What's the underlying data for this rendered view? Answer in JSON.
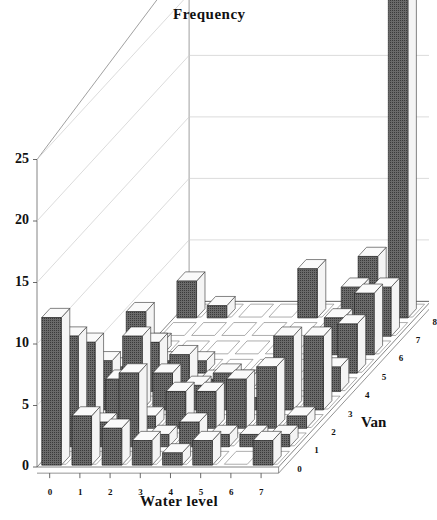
{
  "chart_data": {
    "type": "bar3d",
    "title": "Frequency",
    "xlabel": "Water level",
    "zlabel": "Van",
    "ylabel": "Frequency",
    "y_ticks": [
      "0",
      "5",
      "10",
      "15",
      "20",
      "25"
    ],
    "ylim": [
      0,
      25
    ],
    "x_categories": [
      "0",
      "1",
      "2",
      "3",
      "4",
      "5",
      "6",
      "7"
    ],
    "z_categories": [
      "0",
      "1",
      "2",
      "3",
      "4",
      "5",
      "6",
      "7",
      "8"
    ],
    "grid": true,
    "bar_color": "#555555",
    "values_by_van": [
      {
        "van": "0",
        "values": [
          12,
          4,
          3,
          2,
          1,
          2,
          0,
          2
        ]
      },
      {
        "van": "1",
        "values": [
          9,
          2,
          6,
          1,
          2,
          1,
          1,
          1
        ]
      },
      {
        "van": "2",
        "values": [
          7,
          4,
          1,
          3,
          3,
          4,
          5,
          1
        ]
      },
      {
        "van": "3",
        "values": [
          4,
          6,
          3,
          2,
          3,
          1,
          6,
          6
        ]
      },
      {
        "van": "4",
        "values": [
          2,
          4,
          3,
          1,
          1,
          0,
          0,
          2
        ]
      },
      {
        "van": "5",
        "values": [
          5,
          1,
          1,
          0,
          0,
          0,
          0,
          4
        ]
      },
      {
        "van": "6",
        "values": [
          1,
          0,
          0,
          0,
          0,
          0,
          3,
          5
        ]
      },
      {
        "van": "7",
        "values": [
          0,
          0,
          0,
          0,
          0,
          0,
          4,
          4
        ]
      },
      {
        "van": "8",
        "values": [
          3,
          1,
          0,
          0,
          4,
          0,
          5,
          27
        ]
      }
    ]
  }
}
